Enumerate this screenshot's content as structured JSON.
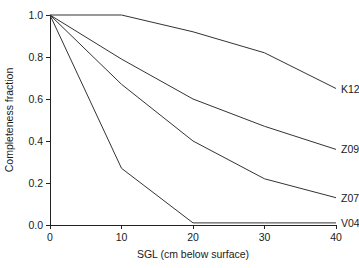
{
  "chart_data": {
    "type": "line",
    "title": "",
    "xlabel": "SGL (cm below surface)",
    "ylabel": "Completeness fraction",
    "xlim": [
      0,
      40
    ],
    "ylim": [
      0.0,
      1.0
    ],
    "grid": false,
    "legend_position": "right-inline-labels",
    "xticks": [
      "0",
      "10",
      "20",
      "30",
      "40"
    ],
    "xtick_values": [
      0,
      10,
      20,
      30,
      40
    ],
    "yticks": [
      "0.0",
      "0.2",
      "0.4",
      "0.6",
      "0.8",
      "1.0"
    ],
    "ytick_values": [
      0.0,
      0.2,
      0.4,
      0.6,
      0.8,
      1.0
    ],
    "x": [
      0,
      10,
      20,
      30,
      40
    ],
    "series": [
      {
        "name": "K12",
        "label": "K12",
        "color": "#333333",
        "values": [
          1.0,
          1.0,
          0.92,
          0.82,
          0.65
        ]
      },
      {
        "name": "Z09",
        "label": "Z09",
        "color": "#333333",
        "values": [
          1.0,
          0.79,
          0.6,
          0.47,
          0.36
        ]
      },
      {
        "name": "Z07",
        "label": "Z07",
        "color": "#333333",
        "values": [
          1.0,
          0.67,
          0.4,
          0.22,
          0.13
        ]
      },
      {
        "name": "V04",
        "label": "V04",
        "color": "#333333",
        "values": [
          1.0,
          0.27,
          0.01,
          0.01,
          0.01
        ]
      }
    ]
  }
}
